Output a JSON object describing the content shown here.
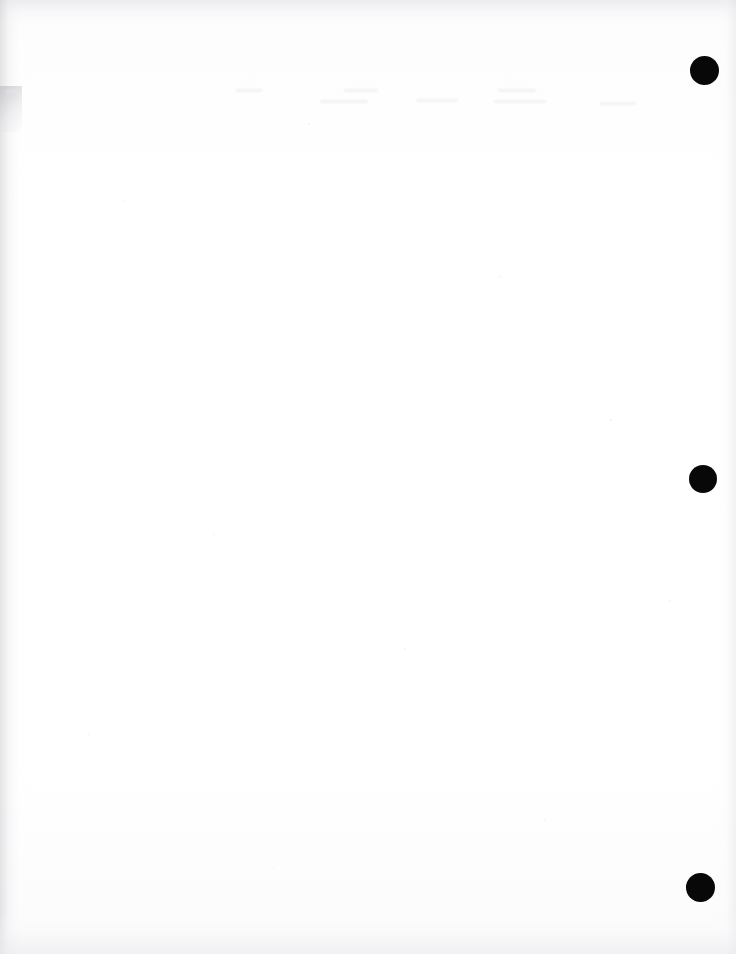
{
  "document": {
    "kind": "scanned-page",
    "title": "Scanned blank page",
    "page_width": 736,
    "page_height": 954,
    "background_color": "#fefefe",
    "body_text": "",
    "visible_text": "",
    "note": "Blank scanned sheet; no legible text rendered in the pixels."
  },
  "marks": {
    "label": "registration marks",
    "color": "#080808",
    "shape": "circle",
    "count": 3,
    "items": [
      {
        "id": "mark-1",
        "name": "top-right-mark",
        "cx": 704,
        "cy": 70,
        "diameter": 29
      },
      {
        "id": "mark-2",
        "name": "middle-right-mark",
        "cx": 703,
        "cy": 479,
        "diameter": 28
      },
      {
        "id": "mark-3",
        "name": "bottom-right-mark",
        "cx": 700,
        "cy": 887,
        "diameter": 29
      }
    ]
  },
  "artifacts": {
    "label": "scanner artifacts",
    "ghost_band": {
      "name": "show-through-text-band",
      "color": "#ececef",
      "top": 86,
      "height": 34,
      "description": "faint horizontal band of illegible ghosted text"
    },
    "corner_smudge": {
      "name": "top-left-gray-smudge",
      "color": "#c4c4c8",
      "top": 86,
      "left": 0,
      "width": 22,
      "height": 46
    },
    "edges": {
      "left_color": "#cdcdd0",
      "right_color": "#e2e2e5",
      "top_color": "#e9e9ec",
      "bottom_color": "#ececef"
    }
  }
}
